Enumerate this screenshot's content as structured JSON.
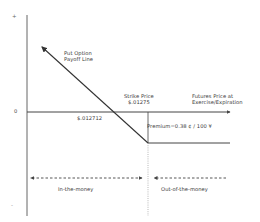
{
  "diagram": {
    "type": "put-option-payoff",
    "y_axis": {
      "plus_label": "+",
      "zero_label": "0",
      "minus_label": "-"
    },
    "x_axis": {
      "label_line1": "Futures Price at",
      "label_line2": "Exercise/Expiration"
    },
    "payoff_line": {
      "label_line1": "Put Option",
      "label_line2": "Payoff Line"
    },
    "strike": {
      "label_line1": "Strike Price",
      "label_line2": "$.01275"
    },
    "breakeven": {
      "label": "$.012712"
    },
    "premium": {
      "label": "Premium=0.38 ¢ / 100 ¥"
    },
    "regions": {
      "in_the_money": "In-the-money",
      "out_of_the_money": "Out-of-the-money"
    },
    "colors": {
      "line": "#333333",
      "axis": "#555555",
      "text": "#3a3a3a",
      "background": "#ffffff"
    }
  }
}
